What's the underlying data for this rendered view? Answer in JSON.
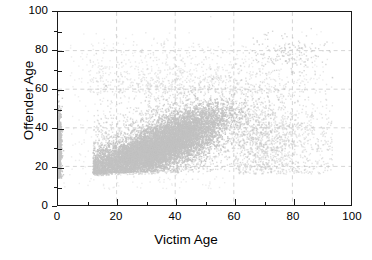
{
  "chart_data": {
    "type": "scatter",
    "title": "",
    "xlabel": "Victim Age",
    "ylabel": "Offender Age",
    "xlim": [
      0,
      100
    ],
    "ylim": [
      0,
      100
    ],
    "xticks": [
      0,
      20,
      40,
      60,
      80,
      100
    ],
    "yticks": [
      0,
      20,
      40,
      60,
      80,
      100
    ],
    "xminorticks": [
      10,
      30,
      50,
      70,
      90
    ],
    "yminorticks": [
      10,
      30,
      50,
      70,
      90
    ],
    "grid": true,
    "grid_style": "dashed",
    "grid_color": "#d0d0d0",
    "legend": "none",
    "marker": {
      "color": "#c2c2c2",
      "size": 1.4,
      "shape": "square",
      "opacity": 0.85
    },
    "axis_color": "#1a1a1a",
    "background": "#ffffff",
    "point_count_approx": 14000,
    "clusters": [
      {
        "name": "unknown-victim-age-band",
        "x_center": 0.6,
        "y_center": 29,
        "x_spread": 1.1,
        "y_spread": 9.5,
        "n": 950,
        "shape": "vertical-band"
      },
      {
        "name": "young-adult-core",
        "x_center": 27,
        "y_center": 25,
        "x_spread": 9,
        "y_spread": 6,
        "n": 3600,
        "shape": "diagonal-core"
      },
      {
        "name": "mid-adult-core",
        "x_center": 38,
        "y_center": 32,
        "x_spread": 9,
        "y_spread": 8,
        "n": 3100,
        "shape": "diagonal-core"
      },
      {
        "name": "upper-diagonal-ridge",
        "x_center": 44,
        "y_center": 41,
        "x_spread": 8,
        "y_spread": 7,
        "n": 1700,
        "shape": "diagonal-ridge"
      },
      {
        "name": "broad-halo",
        "x_center": 38,
        "y_center": 34,
        "x_spread": 17,
        "y_spread": 13,
        "n": 2600,
        "shape": "halo"
      },
      {
        "name": "older-victim-tail",
        "x_center": 64,
        "y_center": 33,
        "x_spread": 14,
        "y_spread": 12,
        "n": 1200,
        "shape": "tail"
      },
      {
        "name": "elderly-sub-cluster",
        "x_center": 78,
        "y_center": 78,
        "x_spread": 7,
        "y_spread": 5,
        "n": 150,
        "shape": "blob"
      },
      {
        "name": "sparse-upper-scatter",
        "x_center": 42,
        "y_center": 58,
        "x_spread": 20,
        "y_spread": 11,
        "n": 700,
        "shape": "sparse"
      }
    ]
  },
  "axes": {
    "x": {
      "title": "Victim Age",
      "tick_labels": [
        "0",
        "20",
        "40",
        "60",
        "80",
        "100"
      ]
    },
    "y": {
      "title": "Offender Age",
      "tick_labels": [
        "0",
        "20",
        "40",
        "60",
        "80",
        "100"
      ]
    }
  }
}
